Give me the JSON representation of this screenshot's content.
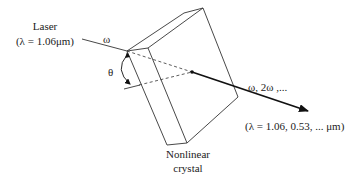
{
  "diagram": {
    "labels": {
      "laser": "Laser",
      "laser_wavelength": "(λ = 1.06μm)",
      "input_frequency": "ω",
      "angle": "θ",
      "output_frequencies": "ω, 2ω ,...",
      "output_wavelengths": "(λ = 1.06, 0.53, ... μm)",
      "crystal_line1": "Nonlinear",
      "crystal_line2": "crystal"
    },
    "colors": {
      "line": "#333333",
      "beam": "#111111",
      "background": "#ffffff"
    }
  }
}
